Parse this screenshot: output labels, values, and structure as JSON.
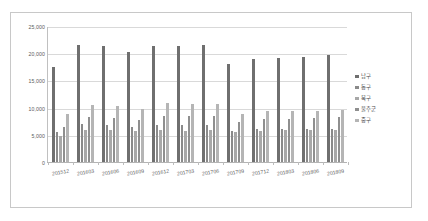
{
  "chart_data": {
    "type": "bar",
    "title": "",
    "subtitle": "",
    "xlabel": "",
    "ylabel": "",
    "ylim": [
      0,
      25000
    ],
    "ytick_labels": [
      "0",
      "5,000",
      "10,000",
      "15,000",
      "20,000",
      "25,000"
    ],
    "ytick_values": [
      0,
      5000,
      10000,
      15000,
      20000,
      25000
    ],
    "grid": "horizontal",
    "legend_position": "right",
    "categories": [
      "201512",
      "201603",
      "201606",
      "201609",
      "201612",
      "201703",
      "201706",
      "201709",
      "201712",
      "201803",
      "201806",
      "201809"
    ],
    "series": [
      {
        "name": "남구",
        "color": "#6f6f6f",
        "values": [
          17500,
          21500,
          21300,
          20200,
          21400,
          21300,
          21450,
          18000,
          18950,
          19150,
          19350,
          19650
        ]
      },
      {
        "name": "동구",
        "color": "#8a8a8a",
        "values": [
          5600,
          6950,
          6850,
          6500,
          6800,
          6750,
          6800,
          5700,
          6000,
          6100,
          6050,
          6150
        ]
      },
      {
        "name": "북구",
        "color": "#a8a8a8",
        "values": [
          4700,
          5800,
          5850,
          5700,
          5800,
          5750,
          5900,
          5500,
          5700,
          5800,
          5900,
          5850
        ]
      },
      {
        "name": "울주군",
        "color": "#8f8f8f",
        "values": [
          6400,
          8300,
          8100,
          7750,
          8550,
          8550,
          8550,
          7400,
          7850,
          7950,
          8000,
          8200
        ]
      },
      {
        "name": "중구",
        "color": "#b5b5b5",
        "values": [
          8800,
          10400,
          10350,
          9800,
          10800,
          10700,
          10700,
          8900,
          9300,
          9300,
          9300,
          9600
        ]
      }
    ]
  },
  "legend": {
    "items": [
      {
        "label": "남구"
      },
      {
        "label": "동구"
      },
      {
        "label": "북구"
      },
      {
        "label": "울주군"
      },
      {
        "label": "중구"
      }
    ]
  }
}
